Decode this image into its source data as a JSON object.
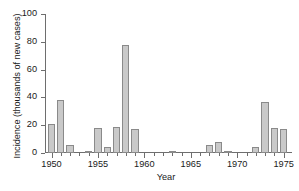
{
  "chart_data": {
    "type": "bar",
    "title": "",
    "subtitle": "",
    "xlabel": "Year",
    "ylabel": "Incidence (thousands of new cases)",
    "categories": [
      1950,
      1951,
      1952,
      1953,
      1954,
      1955,
      1956,
      1957,
      1958,
      1959,
      1960,
      1961,
      1962,
      1963,
      1964,
      1965,
      1966,
      1967,
      1968,
      1969,
      1970,
      1971,
      1972,
      1973,
      1974,
      1975
    ],
    "values": [
      21,
      38,
      6,
      0,
      0.4,
      18,
      4,
      19,
      78,
      17,
      0,
      0,
      0,
      1.5,
      0,
      0,
      0,
      6,
      8,
      0.5,
      0,
      0,
      4,
      37,
      18,
      17.5
    ],
    "xlim": [
      1949.3,
      1975.9
    ],
    "ylim": [
      0,
      100
    ],
    "yticks": [
      0,
      20,
      40,
      60,
      80,
      100
    ],
    "ytick_labels": [
      "0",
      "20",
      "40",
      "60",
      "80",
      "100"
    ],
    "xticks_major": [
      1950,
      1955,
      1960,
      1965,
      1970,
      1975
    ],
    "xtick_labels": [
      "1950",
      "1955",
      "1960",
      "1965",
      "1970",
      "1975"
    ],
    "xticks_minor_step": 1,
    "grid": false,
    "legend": null,
    "bar_fill_color": "#c9c9c9",
    "bar_edge_color": "#8a8a8a",
    "axis_color": "#6e6e6e",
    "text_color": "#1a1a1a",
    "background_color": "#ffffff"
  }
}
